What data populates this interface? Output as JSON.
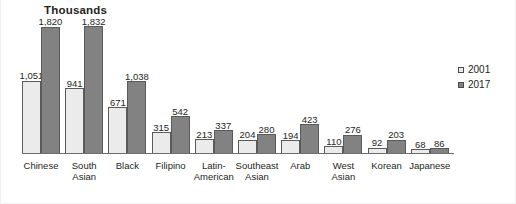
{
  "chart": {
    "title": "Thousands",
    "legend_position": "right"
  },
  "legend": {
    "items": [
      {
        "label": "2001",
        "swatch": "light-square-marker",
        "color": "#ebebeb"
      },
      {
        "label": "2017",
        "swatch": "dark-square-marker",
        "color": "#828282"
      }
    ]
  },
  "colors": {
    "series_2001": "#ebebeb",
    "series_2017": "#828282",
    "bar_outline": "#5a5a5a",
    "axis": "#6e6e6e",
    "text": "#231f20",
    "background": "#ffffff"
  },
  "chart_data": {
    "type": "bar",
    "title": "Thousands",
    "xlabel": "",
    "ylabel": "Thousands",
    "ylim": [
      0,
      1832
    ],
    "grid": false,
    "legend_position": "right",
    "categories": [
      "Chinese",
      "South Asian",
      "Black",
      "Filipino",
      "Latin-American",
      "Southeast Asian",
      "Arab",
      "West Asian",
      "Korean",
      "Japanese"
    ],
    "series": [
      {
        "name": "2001",
        "values": [
          1051,
          941,
          671,
          315,
          213,
          204,
          194,
          110,
          92,
          68
        ],
        "labels": [
          "1,051",
          "941",
          "671",
          "315",
          "213",
          "204",
          "194",
          "110",
          "92",
          "68"
        ]
      },
      {
        "name": "2017",
        "values": [
          1820,
          1832,
          1038,
          542,
          337,
          280,
          423,
          276,
          203,
          86
        ],
        "labels": [
          "1,820",
          "1,832",
          "1,038",
          "542",
          "337",
          "280",
          "423",
          "276",
          "203",
          "86"
        ]
      }
    ],
    "category_label_lines": [
      [
        "Chinese"
      ],
      [
        "South",
        "Asian"
      ],
      [
        "Black"
      ],
      [
        "Filipino"
      ],
      [
        "Latin-",
        "American"
      ],
      [
        "Southeast",
        "Asian"
      ],
      [
        "Arab"
      ],
      [
        "West",
        "Asian"
      ],
      [
        "Korean"
      ],
      [
        "Japanese"
      ]
    ]
  }
}
